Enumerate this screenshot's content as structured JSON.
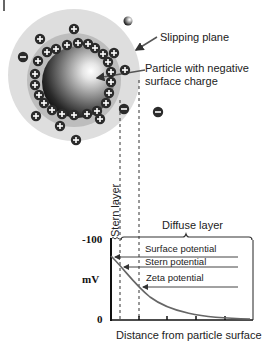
{
  "diagram": {
    "title_fragment": "",
    "labels": {
      "slipping_plane": "Slipping plane",
      "particle_line1": "Particle with negative",
      "particle_line2": "surface charge",
      "stern_layer": "Stern layer",
      "diffuse_layer": "Diffuse layer"
    },
    "ion_symbols": {
      "positive": "+",
      "negative": "−"
    },
    "colors": {
      "slipping_region": "#dedede",
      "stern_ring": "#bdbdbd",
      "particle_dark": "#1a1a1a",
      "particle_light": "#ffffff",
      "ion_fill": "#2b2b2b",
      "arrow": "#555555",
      "curve": "#666666"
    }
  },
  "chart_data": {
    "type": "line",
    "title": "",
    "xlabel": "Distance from particle surface",
    "ylabel": "mV",
    "y_ticks": [
      "-100",
      "0"
    ],
    "ylim": [
      0,
      -100
    ],
    "series": [
      {
        "name": "Potential",
        "x": [
          0,
          0.1,
          0.2,
          0.35,
          0.5,
          0.7,
          0.85,
          1.0
        ],
        "values": [
          -80,
          -68,
          -48,
          -28,
          -15,
          -6,
          -2,
          0
        ]
      }
    ],
    "annotations": [
      {
        "label": "Surface potential",
        "value": -80
      },
      {
        "label": "Stern potential",
        "value": -68
      },
      {
        "label": "Zeta potential",
        "value": -43
      }
    ],
    "regions": [
      "Stern layer",
      "Diffuse layer"
    ]
  }
}
